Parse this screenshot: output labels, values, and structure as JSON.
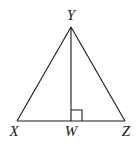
{
  "diagram": {
    "vertices": {
      "Y": {
        "label": "Y",
        "x": 71,
        "y": 27
      },
      "X": {
        "label": "X",
        "x": 17,
        "y": 121
      },
      "Z": {
        "label": "Z",
        "x": 125,
        "y": 121
      },
      "W": {
        "label": "W",
        "x": 71,
        "y": 121
      }
    },
    "labels": {
      "Y": "Y",
      "X": "X",
      "W": "W",
      "Z": "Z"
    },
    "segments": [
      {
        "from": "X",
        "to": "Y"
      },
      {
        "from": "Y",
        "to": "Z"
      },
      {
        "from": "X",
        "to": "Z"
      },
      {
        "from": "Y",
        "to": "W"
      }
    ],
    "right_angle_marker": {
      "at": "W",
      "size": 11
    },
    "colors": {
      "stroke": "#1a1a1a",
      "background": "#ffffff"
    }
  }
}
